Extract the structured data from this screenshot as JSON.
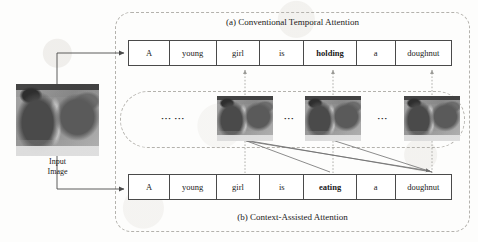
{
  "figure": {
    "panel_a_caption": "(a) Conventional Temporal Attention",
    "panel_b_caption": "(b) Context-Assisted Attention",
    "input_image_caption": "Input\nImage",
    "ellipsis_long": "··· ···",
    "ellipsis_short": "···",
    "colors": {
      "line": "#4a4a4a",
      "dashed_border": "#b4b2ad",
      "attention_line": "#6f6f6f",
      "text": "#1a1a1a",
      "background": "#fdfdfc"
    }
  },
  "sentences": {
    "top": {
      "id": "conventional-temporal-attention-sentence",
      "words": [
        {
          "text": "A",
          "emphasis": false
        },
        {
          "text": "young",
          "emphasis": false
        },
        {
          "text": "girl",
          "emphasis": false
        },
        {
          "text": "is",
          "emphasis": false
        },
        {
          "text": "holding",
          "emphasis": true
        },
        {
          "text": "a",
          "emphasis": false
        },
        {
          "text": "doughnut",
          "emphasis": false
        }
      ]
    },
    "bottom": {
      "id": "context-assisted-attention-sentence",
      "words": [
        {
          "text": "A",
          "emphasis": false
        },
        {
          "text": "young",
          "emphasis": false
        },
        {
          "text": "girl",
          "emphasis": false
        },
        {
          "text": "is",
          "emphasis": false
        },
        {
          "text": "eating",
          "emphasis": true
        },
        {
          "text": "a",
          "emphasis": false
        },
        {
          "text": "doughnut",
          "emphasis": false
        }
      ]
    }
  },
  "frames": [
    {
      "id": "video-frame-1",
      "label": "frame"
    },
    {
      "id": "video-frame-2",
      "label": "frame"
    },
    {
      "id": "video-frame-3",
      "label": "frame"
    }
  ]
}
